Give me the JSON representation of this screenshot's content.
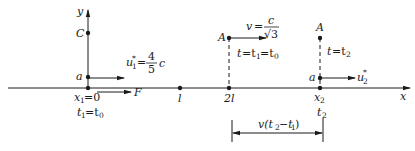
{
  "diagram": {
    "axes": {
      "x_label": "x",
      "y_label": "y"
    },
    "y_axis_points": {
      "C": "C",
      "a": "a"
    },
    "origin": {
      "x_label": "x",
      "x_sub": "1",
      "x_eq": "=0",
      "t_label": "t",
      "t_sub": "1",
      "t_eq": "=t",
      "t_rhs_sub": "0"
    },
    "force": {
      "label": "F"
    },
    "u1": {
      "label": "u",
      "sub": "1",
      "star": "*",
      "eq": "=",
      "num": "4",
      "den": "5",
      "unit": "c"
    },
    "ticks": [
      {
        "label": "l"
      },
      {
        "label": "2l"
      }
    ],
    "frame_A_start": {
      "label": "A",
      "v_label": "v",
      "v_eq": "=",
      "v_num": "c",
      "v_den": "√3",
      "time_text_1": "t",
      "time_eq_1": "=t",
      "time_sub_1": "1",
      "time_eq_2": "=t",
      "time_sub_2": "0"
    },
    "frame_end": {
      "A_label": "A",
      "a_label": "a",
      "time_t": "t",
      "time_eq": "=t",
      "time_sub": "2",
      "u2_label": "u",
      "u2_sub": "2",
      "u2_star": "*",
      "x_label": "x",
      "x_sub": "2",
      "t_label": "t",
      "t_sub": "2"
    },
    "dimension": {
      "label_v": "v(t",
      "label_sub_2": "2",
      "label_minus": "−t",
      "label_sub_1": "1",
      "label_close": ")"
    },
    "colors": {
      "ink": "#1a1a1a",
      "background": "#ffffff"
    }
  }
}
